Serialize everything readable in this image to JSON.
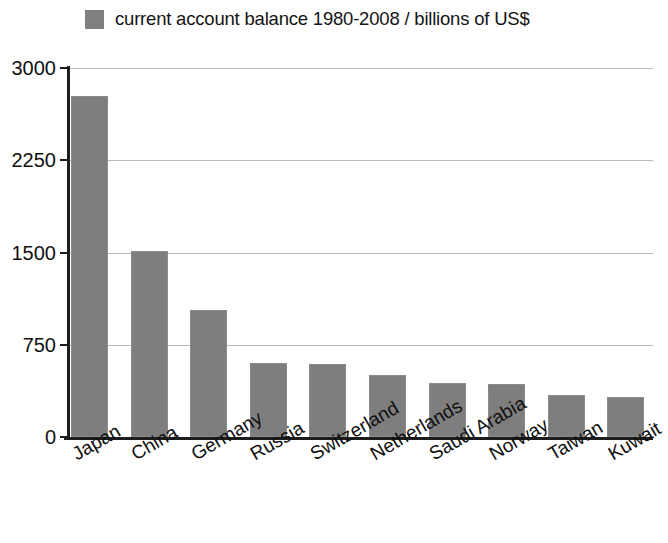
{
  "legend": {
    "label": "current account balance 1980-2008 / billions of US$",
    "swatch_color": "#808080",
    "swatch_icon": "legend-color-swatch"
  },
  "axes": {
    "y_ticks": [
      "3000",
      "2250",
      "1500",
      "750",
      "0"
    ],
    "x_ticks": [
      "Japan",
      "China",
      "Germany",
      "Russia",
      "Switzerland",
      "Netherlands",
      "Saudi Arabia",
      "Norway",
      "Taiwan",
      "Kuwait"
    ]
  },
  "colors": {
    "bar": "#7e7e7e",
    "gridline": "#b9b9b9",
    "axis": "#1d1d1d",
    "text": "#101010",
    "background": "#ffffff"
  },
  "chart_data": {
    "type": "bar",
    "title": "current account balance 1980-2008 / billions of US$",
    "xlabel": "",
    "ylabel": "",
    "ylim": [
      0,
      3000
    ],
    "yticks": [
      0,
      750,
      1500,
      2250,
      3000
    ],
    "grid": true,
    "legend_position": "top-left",
    "categories": [
      "Japan",
      "China",
      "Germany",
      "Russia",
      "Switzerland",
      "Netherlands",
      "Saudi Arabia",
      "Norway",
      "Taiwan",
      "Kuwait"
    ],
    "values": [
      2770,
      1510,
      1030,
      600,
      590,
      505,
      440,
      430,
      345,
      325
    ],
    "series": [
      {
        "name": "current account balance 1980-2008 / billions of US$",
        "values": [
          2770,
          1510,
          1030,
          600,
          590,
          505,
          440,
          430,
          345,
          325
        ]
      }
    ]
  }
}
